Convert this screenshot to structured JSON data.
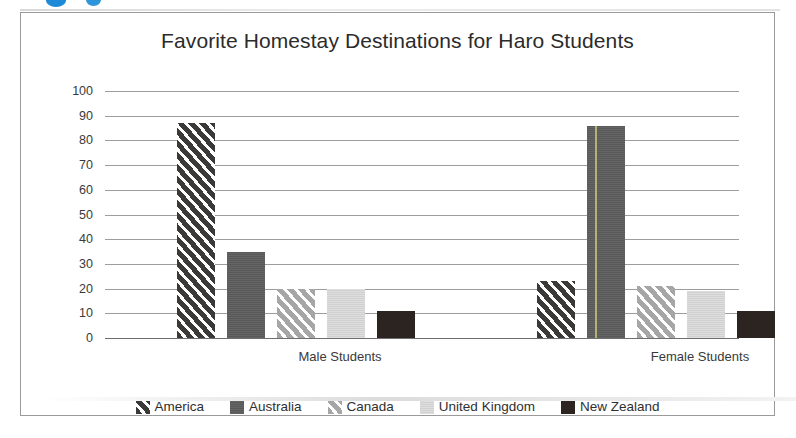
{
  "figure": {
    "title": "Favorite Homestay Destinations for Haro Students",
    "border_color": "#9a9a9a",
    "background": "#ffffff"
  },
  "artifacts": {
    "blue_mark_color": "#1c8ad6",
    "fold_line_color": "#b9b47a"
  },
  "chart_data": {
    "type": "bar",
    "title": "Favorite Homestay Destinations for Haro Students",
    "xlabel": "",
    "ylabel": "",
    "ylim": [
      0,
      100
    ],
    "yticks": [
      0,
      10,
      20,
      30,
      40,
      50,
      60,
      70,
      80,
      90,
      100
    ],
    "ytick_labels": [
      "0",
      "10",
      "20",
      "30",
      "40",
      "50",
      "60",
      "70",
      "80",
      "90",
      "100"
    ],
    "grid": true,
    "legend_position": "bottom",
    "categories": [
      "Male Students",
      "Female Students"
    ],
    "series": [
      {
        "name": "America",
        "values": [
          87,
          23
        ],
        "color": "#3b3a38",
        "pattern": "diagonal-stripe-dark"
      },
      {
        "name": "Australia",
        "values": [
          35,
          86
        ],
        "color": "#5d5d5d",
        "pattern": "solid-medium-gray"
      },
      {
        "name": "Canada",
        "values": [
          20,
          21
        ],
        "color": "#a6a6a6",
        "pattern": "diagonal-stripe-light"
      },
      {
        "name": "United Kingdom",
        "values": [
          20,
          19
        ],
        "color": "#d7d7d7",
        "pattern": "solid-light-gray"
      },
      {
        "name": "New Zealand",
        "values": [
          11,
          11
        ],
        "color": "#2b2420",
        "pattern": "solid-black"
      }
    ]
  }
}
